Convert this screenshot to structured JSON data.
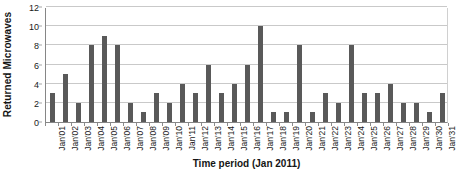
{
  "chart_data": {
    "type": "bar",
    "title": "",
    "xlabel": "Time period (Jan 2011)",
    "ylabel": "Returned Microwaves",
    "ylim": [
      0,
      12
    ],
    "yticks": [
      0,
      2,
      4,
      6,
      8,
      10,
      12
    ],
    "grid": true,
    "legend": null,
    "bar_color": "#595959",
    "categories": [
      "Jan'01",
      "Jan'02",
      "Jan'03",
      "Jan'04",
      "Jan'05",
      "Jan'06",
      "Jan'07",
      "Jan'08",
      "Jan'09",
      "Jan'10",
      "Jan'11",
      "Jan'12",
      "Jan'13",
      "Jan'14",
      "Jan'15",
      "Jan'16",
      "Jan'17",
      "Jan'18",
      "Jan'19",
      "Jan'20",
      "Jan'21",
      "Jan'22",
      "Jan'23",
      "Jan'24",
      "Jan'25",
      "Jan'26",
      "Jan'27",
      "Jan'28",
      "Jan'29",
      "Jan'30",
      "Jan'31"
    ],
    "values": [
      3,
      5,
      2,
      8,
      9,
      8,
      2,
      1,
      3,
      2,
      4,
      3,
      6,
      3,
      4,
      6,
      10,
      1,
      1,
      8,
      1,
      3,
      2,
      8,
      3,
      3,
      4,
      2,
      2,
      1,
      3
    ]
  }
}
